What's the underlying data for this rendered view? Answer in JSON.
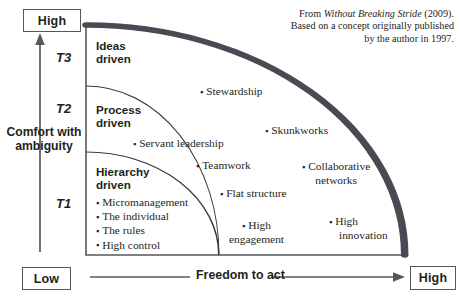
{
  "axes": {
    "y_caption": "Comfort with ambiguity",
    "y_high_label": "High",
    "y_low_label": "Low",
    "x_caption": "Freedom to act",
    "x_high_label": "High",
    "tiers": [
      {
        "id": "T1",
        "label": "T1"
      },
      {
        "id": "T2",
        "label": "T2"
      },
      {
        "id": "T3",
        "label": "T3"
      }
    ]
  },
  "bands": [
    {
      "id": "hierarchy",
      "heading_line1": "Hierarchy",
      "heading_line2": "driven"
    },
    {
      "id": "process",
      "heading_line1": "Process",
      "heading_line2": "driven"
    },
    {
      "id": "ideas",
      "heading_line1": "Ideas",
      "heading_line2": "driven"
    }
  ],
  "tier1_items": [
    "Micromanagement",
    "The individual",
    "The rules",
    "High control"
  ],
  "points": [
    {
      "id": "stewardship",
      "line1": "Stewardship",
      "line2": ""
    },
    {
      "id": "servant",
      "line1": "Servant leadership",
      "line2": ""
    },
    {
      "id": "teamwork",
      "line1": "Teamwork",
      "line2": ""
    },
    {
      "id": "skunkworks",
      "line1": "Skunkworks",
      "line2": ""
    },
    {
      "id": "collaborative",
      "line1": "Collaborative",
      "line2": "networks"
    },
    {
      "id": "flat",
      "line1": "Flat structure",
      "line2": ""
    },
    {
      "id": "engagement",
      "line1": "High",
      "line2": "engagement"
    },
    {
      "id": "innovation",
      "line1": "High",
      "line2": "innovation"
    }
  ],
  "attribution": {
    "line1_prefix": "From ",
    "line1_title": "Without Breaking Stride",
    "line1_suffix": " (2009).",
    "line2": "Based on a concept originally published",
    "line3": "by the author in 1997."
  },
  "bullet_glyph": "▪",
  "colors": {
    "ink": "#231f20",
    "frame": "#58585b",
    "thick_arc": "#4a4a52",
    "thin_arc": "#3a3a3c",
    "axis_line": "#58585b"
  }
}
